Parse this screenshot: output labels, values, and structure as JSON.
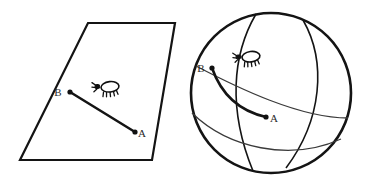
{
  "figure": {
    "title": "",
    "background_color": "#ffffff",
    "line_color": "#141414",
    "thin_line_color": "#3a3a3a",
    "label_color": "#2b2b2b",
    "width": 366,
    "height": 184
  },
  "panels": [
    {
      "id": "plane-panel",
      "shape": "parallelogram",
      "description": "flat plane",
      "outline_points": "88,23 175,23 152,160 20,160",
      "path_type": "straight-line",
      "path_d": "M 70 92 L 135 132",
      "points": [
        {
          "name": "B",
          "label": "B",
          "cx": 70,
          "cy": 92,
          "r": 2.6,
          "label_x": 58,
          "label_y": 92
        },
        {
          "name": "A",
          "label": "A",
          "cx": 135,
          "cy": 132,
          "r": 2.6,
          "label_x": 140,
          "label_y": 136
        }
      ],
      "creature": {
        "name": "insect",
        "x": 108,
        "y": 87,
        "scale": 1.0,
        "rotation": -6
      }
    },
    {
      "id": "sphere-panel",
      "shape": "sphere",
      "description": "sphere with great circles",
      "center_x": 271,
      "center_y": 93,
      "radius": 80,
      "great_circles": [
        {
          "name": "meridian-front",
          "d": "M 256 14 C 232 55 228 110 253 171"
        },
        {
          "name": "meridian-right",
          "d": "M 303 20 C 327 62 322 120 286 168"
        },
        {
          "name": "equator-upper",
          "d": "M 196 66 C 238 88 300 118 348 118"
        },
        {
          "name": "equator-lower",
          "d": "M 192 113 C 228 148 290 162 341 139"
        }
      ],
      "path_type": "geodesic-arc",
      "path_d": "M 212 68 Q 226 108 266 117",
      "points": [
        {
          "name": "B",
          "label": "B",
          "cx": 212,
          "cy": 68,
          "r": 2.6,
          "label_x": 200,
          "label_y": 68
        },
        {
          "name": "A",
          "label": "A",
          "cx": 266,
          "cy": 117,
          "r": 2.6,
          "label_x": 271,
          "label_y": 121
        }
      ],
      "creature": {
        "name": "insect",
        "x": 249,
        "y": 57,
        "scale": 1.0,
        "rotation": -8
      }
    }
  ]
}
